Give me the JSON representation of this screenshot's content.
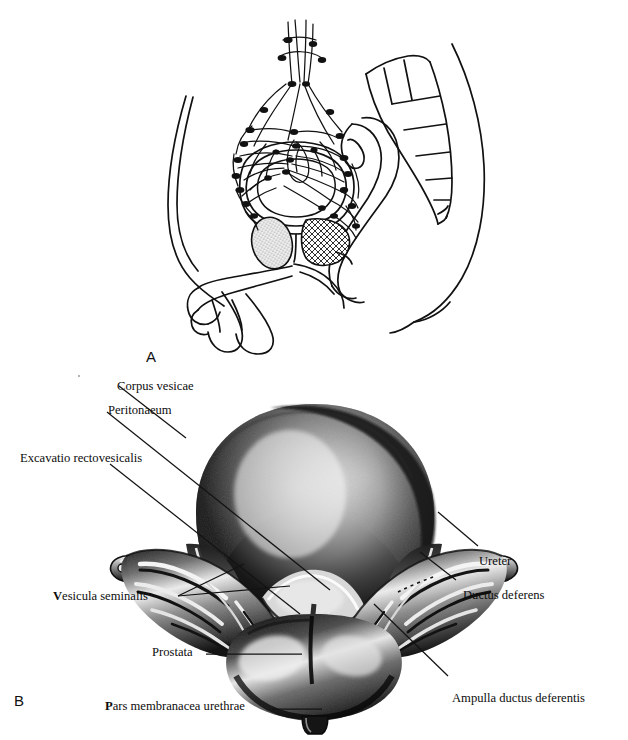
{
  "figure": {
    "background": "#ffffff",
    "ink": "#111111",
    "panels": [
      {
        "letter": "A",
        "name": "panel-a",
        "kind": "line-drawing",
        "description": "Median sagittal schematic of the male pelvis showing the lymphatic vessel network and nodes around the urinary bladder, with sacrum, rectum, prostate and penis in outline."
      },
      {
        "letter": "B",
        "name": "panel-b",
        "kind": "halftone-engraving",
        "description": "Posterior view of the urinary bladder with seminal vesicles, ampullae of the ductus deferens and prostate."
      }
    ]
  },
  "labels": {
    "corpus_vesicae": "Corpus vesicae",
    "peritonaeum": "Peritonaeum",
    "excavatio_rectovesicalis": "Excavatio rectovesicalis",
    "ureter": "Ureter",
    "ductus_deferens": "Ductus deferens",
    "vesicula_seminalis_bold": "V",
    "vesicula_seminalis_rest": "esicula seminalis",
    "prostata": "Prostata",
    "ampulla_ductus_deferentis": "Ampulla ductus deferentis",
    "pars_membranacea_bold": "P",
    "pars_membranacea_rest": "ars membranacea urethrae"
  },
  "panel_letters": {
    "a": "A",
    "b": "B"
  }
}
